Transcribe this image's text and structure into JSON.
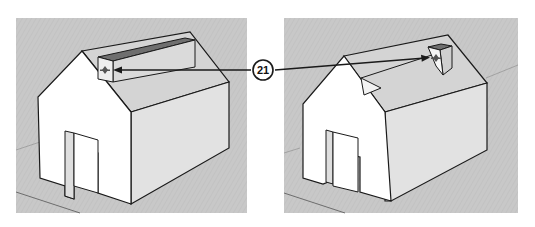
{
  "figure": {
    "callout": {
      "label": "21"
    },
    "panels": [
      {
        "name": "before",
        "description": "House model with long roof box; move cursor at front-left of box"
      },
      {
        "name": "after",
        "description": "House model with short roof box moved toward back ridge; move cursor on box"
      }
    ]
  },
  "colors": {
    "background": "#ffffff",
    "ground": "#c6c6c6",
    "wall_front": "#ffffff",
    "wall_side": "#e4e4e4",
    "roof": "#d6d6d6",
    "edge": "#1a1a1a"
  }
}
